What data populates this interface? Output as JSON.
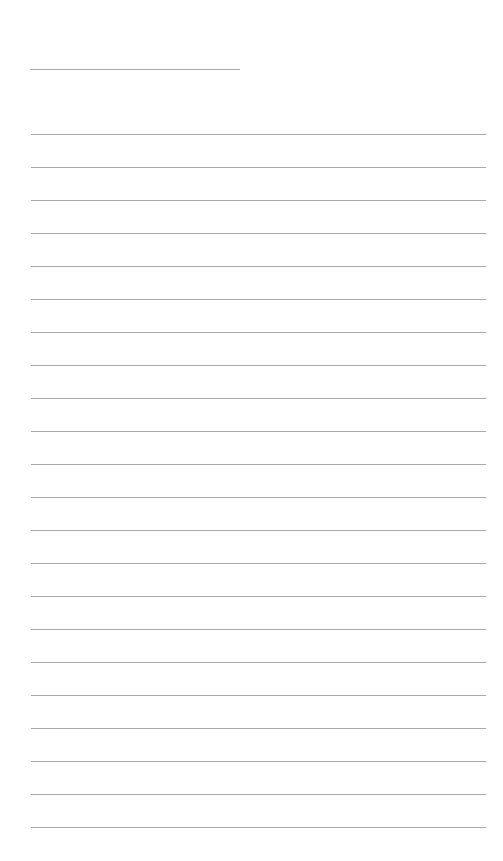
{
  "document": {
    "type": "blank lined writing page",
    "background_color": "#ffffff",
    "rule_color": "#a9a9a9",
    "title_line": {
      "x": 30,
      "y": 69,
      "width": 210
    },
    "writing_lines": {
      "count": 22,
      "x": 31,
      "first_y": 134,
      "spacing": 33,
      "width": 455
    }
  }
}
